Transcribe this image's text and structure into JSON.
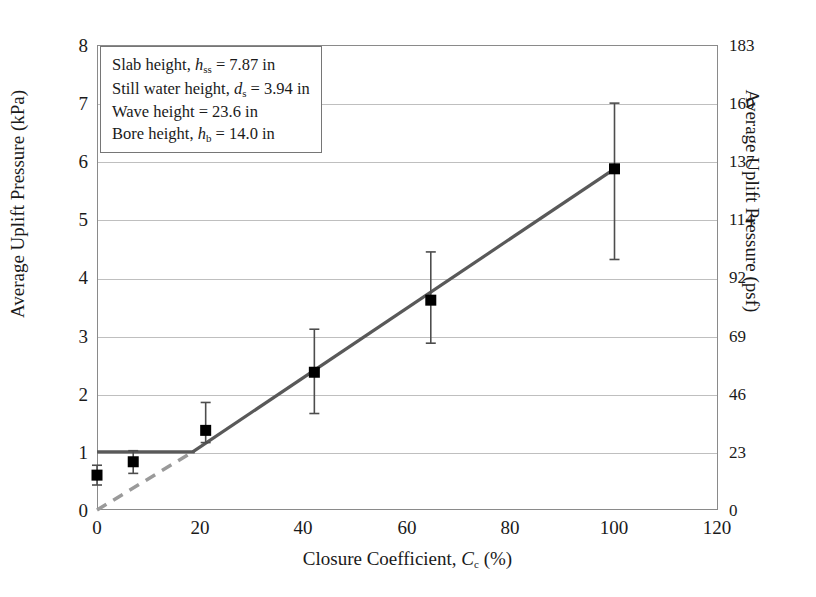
{
  "chart_data": {
    "type": "scatter",
    "title": "",
    "xlabel": "Closure Coefficient, C_c (%)",
    "ylabel": "Average Uplift Pressure (kPa)",
    "ylabel_secondary": "Average Uplift Pressure (psf)",
    "xlim": [
      0,
      120
    ],
    "ylim": [
      0,
      8
    ],
    "ylim_secondary": [
      0,
      183
    ],
    "grid": true,
    "legend": "none",
    "xticks": [
      "0",
      "20",
      "40",
      "60",
      "80",
      "100",
      "120"
    ],
    "yticks": [
      "0",
      "1",
      "2",
      "3",
      "4",
      "5",
      "6",
      "7",
      "8"
    ],
    "yticks_secondary": [
      "0",
      "23",
      "46",
      "69",
      "92",
      "114",
      "137",
      "160",
      "183"
    ],
    "x": [
      0,
      7,
      21,
      42,
      64.5,
      100
    ],
    "values": [
      0.6,
      0.83,
      1.37,
      2.37,
      3.61,
      5.87
    ],
    "error_low": [
      0.43,
      0.63,
      1.16,
      1.66,
      2.87,
      4.31
    ],
    "error_high": [
      0.77,
      1.02,
      1.85,
      3.11,
      4.44,
      7.0
    ],
    "series": [
      {
        "name": "Average uplift pressure",
        "marker": "filled-square",
        "marker_color": "#000000",
        "values": [
          0.6,
          0.83,
          1.37,
          2.37,
          3.61,
          5.87
        ]
      }
    ],
    "trend_line": {
      "name": "Linear trend (sloped segment)",
      "style": "solid",
      "color": "#595959",
      "x_start": 18.5,
      "y_start": 1.0,
      "x_end": 100,
      "y_end": 5.87
    },
    "threshold_line": {
      "name": "Constant uplift plateau",
      "style": "solid",
      "color": "#595959",
      "x_start": 0,
      "x_end": 18.5,
      "y": 1.0
    },
    "extrapolation_line": {
      "name": "Dashed extrapolation to origin",
      "style": "dashed",
      "color": "#9a9a9a",
      "x_start": 0,
      "y_start": 0,
      "x_end": 18.5,
      "y_end": 1.0
    }
  },
  "annotation": {
    "lines": [
      "Slab height, h_ss = 7.87 in",
      "Still water height, d_s = 3.94 in",
      "Wave height = 23.6 in",
      "Bore height, h_b = 14.0 in"
    ],
    "line1_pre": "Slab height, ",
    "line1_var": "h",
    "line1_sub": "ss",
    "line1_post": " = 7.87 in",
    "line2_pre": "Still water height, ",
    "line2_var": "d",
    "line2_sub": "s",
    "line2_post": " = 3.94 in",
    "line3_text": "Wave height = 23.6 in",
    "line4_pre": "Bore height, ",
    "line4_var": "h",
    "line4_sub": "b",
    "line4_post": " = 14.0 in"
  },
  "axis": {
    "x_title_pre": "Closure Coefficient, ",
    "x_title_var": "C",
    "x_title_sub": "c",
    "x_title_post": " (%)",
    "y_title_left": "Average Uplift Pressure (kPa)",
    "y_title_right": "Average Uplift Pressure (psf)"
  },
  "colors": {
    "marker": "#000000",
    "trend": "#595959",
    "dashed": "#9a9a9a",
    "grid": "#bfbfbf",
    "frame": "#8a8a8a",
    "error_bar": "#4d4d4d"
  }
}
